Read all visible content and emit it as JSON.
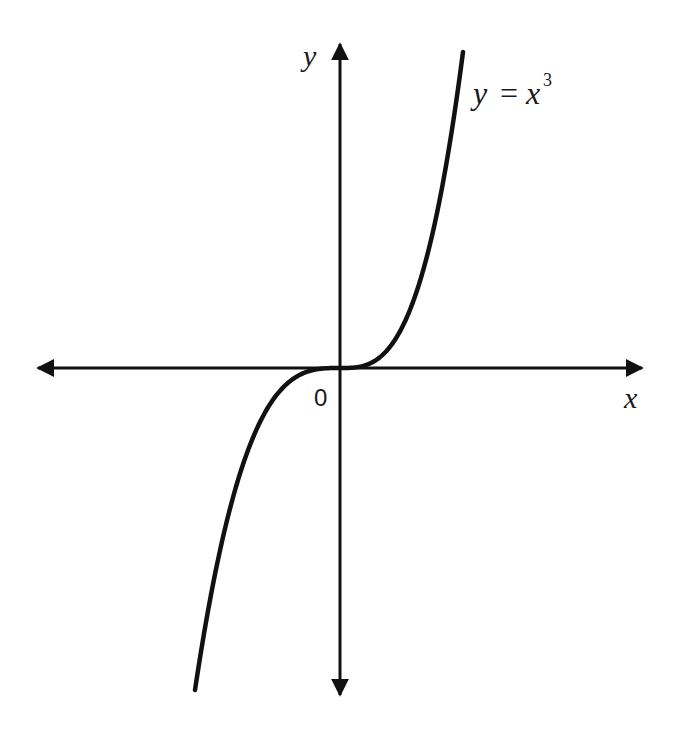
{
  "diagram": {
    "axes": {
      "x_label": "x",
      "y_label": "y",
      "origin_label": "0"
    },
    "curve_label": {
      "lhs": "y",
      "eq": "=",
      "base": "x",
      "exponent": "3"
    },
    "colors": {
      "stroke": "#111111",
      "background": "#ffffff"
    }
  },
  "chart_data": {
    "type": "line",
    "xlabel": "x",
    "ylabel": "y",
    "function": "y = x^3",
    "grid": false,
    "ticks": "none",
    "origin_label": "0",
    "series": [
      {
        "name": "y = x^3",
        "x": [
          -1.0,
          -0.75,
          -0.5,
          -0.25,
          0,
          0.25,
          0.5,
          0.75,
          1.0
        ],
        "y": [
          -1.0,
          -0.421875,
          -0.125,
          -0.015625,
          0,
          0.015625,
          0.125,
          0.421875,
          1.0
        ]
      }
    ]
  }
}
